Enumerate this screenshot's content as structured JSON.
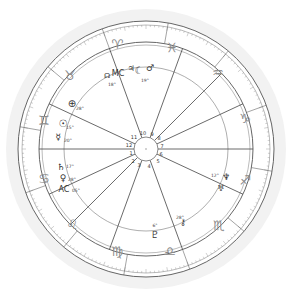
{
  "chart": {
    "center": [
      146,
      149
    ],
    "halo_color": "#f2f2f2",
    "line_color": "#555555",
    "sign_color": "#8a8a8a",
    "planet_color": "#333333"
  },
  "signs": [
    {
      "name": "aries",
      "glyph": "♈",
      "pos": [
        117,
        44
      ]
    },
    {
      "name": "pisces",
      "glyph": "♓",
      "pos": [
        172,
        47
      ]
    },
    {
      "name": "aquarius",
      "glyph": "♒",
      "pos": [
        218,
        72
      ]
    },
    {
      "name": "capricorn",
      "glyph": "♑",
      "pos": [
        245,
        118
      ]
    },
    {
      "name": "sagittarius",
      "glyph": "♐",
      "pos": [
        245,
        180
      ]
    },
    {
      "name": "scorpio",
      "glyph": "♏",
      "pos": [
        219,
        225
      ]
    },
    {
      "name": "libra",
      "glyph": "♎",
      "pos": [
        170,
        251
      ]
    },
    {
      "name": "virgo",
      "glyph": "♍",
      "pos": [
        117,
        251
      ]
    },
    {
      "name": "leo",
      "glyph": "♌",
      "pos": [
        72,
        224
      ]
    },
    {
      "name": "cancer",
      "glyph": "♋",
      "pos": [
        44,
        178
      ]
    },
    {
      "name": "gemini",
      "glyph": "♊",
      "pos": [
        44,
        120
      ]
    },
    {
      "name": "taurus",
      "glyph": "♉",
      "pos": [
        70,
        75
      ]
    }
  ],
  "houses": [
    {
      "num": "1",
      "pos": [
        131,
        153
      ]
    },
    {
      "num": "2",
      "pos": [
        133,
        161
      ]
    },
    {
      "num": "3",
      "pos": [
        139,
        165
      ]
    },
    {
      "num": "4",
      "pos": [
        149,
        166
      ]
    },
    {
      "num": "5",
      "pos": [
        158,
        161
      ]
    },
    {
      "num": "6",
      "pos": [
        161,
        154
      ]
    },
    {
      "num": "7",
      "pos": [
        162,
        146
      ]
    },
    {
      "num": "8",
      "pos": [
        159,
        138
      ]
    },
    {
      "num": "9",
      "pos": [
        152,
        134
      ]
    },
    {
      "num": "10",
      "pos": [
        143,
        133
      ]
    },
    {
      "num": "11",
      "pos": [
        134,
        137
      ]
    },
    {
      "num": "12",
      "pos": [
        129,
        145
      ]
    }
  ],
  "cusp_angles": [
    180,
    205,
    225,
    250,
    290,
    335,
    0,
    25,
    45,
    70,
    110,
    155
  ],
  "planets": [
    {
      "name": "midheaven",
      "glyph": "MC",
      "pos": [
        118,
        73
      ],
      "size": 8
    },
    {
      "name": "jupiter-top",
      "glyph": "♃",
      "pos": [
        131,
        68
      ],
      "size": 8
    },
    {
      "name": "moon",
      "glyph": "☾",
      "pos": [
        139,
        70
      ],
      "size": 10
    },
    {
      "name": "mars",
      "glyph": "♂",
      "pos": [
        150,
        68
      ],
      "size": 9
    },
    {
      "name": "node",
      "glyph": "☊",
      "pos": [
        107,
        76
      ],
      "size": 7
    },
    {
      "name": "part-of-fortune",
      "glyph": "⊕",
      "pos": [
        72,
        103
      ],
      "size": 10
    },
    {
      "name": "sun",
      "glyph": "☉",
      "pos": [
        63,
        123
      ],
      "size": 10
    },
    {
      "name": "mercury",
      "glyph": "☿",
      "pos": [
        58,
        137
      ],
      "size": 9
    },
    {
      "name": "saturn",
      "glyph": "♄",
      "pos": [
        61,
        167
      ],
      "size": 9
    },
    {
      "name": "venus",
      "glyph": "♀",
      "pos": [
        63,
        178
      ],
      "size": 9
    },
    {
      "name": "ascendant",
      "glyph": "AC",
      "pos": [
        64,
        189
      ],
      "size": 8
    },
    {
      "name": "neptune",
      "glyph": "♆",
      "pos": [
        226,
        177
      ],
      "size": 9
    },
    {
      "name": "uranus",
      "glyph": "♅",
      "pos": [
        221,
        188
      ],
      "size": 8
    },
    {
      "name": "chiron",
      "glyph": "⚷",
      "pos": [
        183,
        222
      ],
      "size": 9
    },
    {
      "name": "pluto",
      "glyph": "♇",
      "pos": [
        155,
        234
      ],
      "size": 10
    }
  ],
  "degrees": [
    {
      "text": "28°",
      "pos": [
        80,
        108
      ]
    },
    {
      "text": "15°",
      "pos": [
        70,
        127
      ]
    },
    {
      "text": "20°",
      "pos": [
        68,
        140
      ]
    },
    {
      "text": "17°",
      "pos": [
        70,
        166
      ]
    },
    {
      "text": "28°",
      "pos": [
        72,
        179
      ]
    },
    {
      "text": "05°",
      "pos": [
        76,
        190
      ]
    },
    {
      "text": "12°",
      "pos": [
        215,
        175
      ]
    },
    {
      "text": "28°",
      "pos": [
        180,
        217
      ]
    },
    {
      "text": "6°",
      "pos": [
        155,
        225
      ]
    },
    {
      "text": "18°",
      "pos": [
        112,
        84
      ]
    },
    {
      "text": "19°",
      "pos": [
        145,
        80
      ]
    }
  ]
}
